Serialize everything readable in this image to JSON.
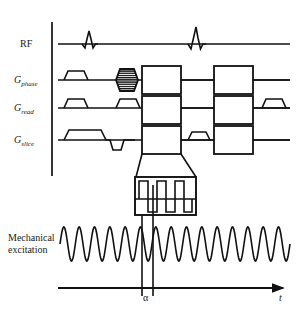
{
  "figure": {
    "background_color": "#ffffff",
    "line_color": "#111111"
  },
  "channels": [
    {
      "id": "rf",
      "label": "RF",
      "sub": "",
      "baseline_y": 44
    },
    {
      "id": "gphase",
      "label": "G",
      "sub": "phase",
      "baseline_y": 80
    },
    {
      "id": "gread",
      "label": "G",
      "sub": "read",
      "baseline_y": 108
    },
    {
      "id": "gslice",
      "label": "G",
      "sub": "slice",
      "baseline_y": 140
    }
  ],
  "mechanical": {
    "label_line1": "Mechanical",
    "label_line2": "excitation",
    "cycles": 15,
    "amplitude": 17
  },
  "axis": {
    "time_label": "t",
    "marker_label": "α",
    "axis_y": 288,
    "arrow_x": 283
  },
  "inset": {
    "name": "magnified-motion-encoding-gradient",
    "waveform": "square",
    "cycles": 3
  },
  "colors": {
    "stroke": "#111111",
    "fill": "#ffffff",
    "text": "#1a1a1a"
  }
}
